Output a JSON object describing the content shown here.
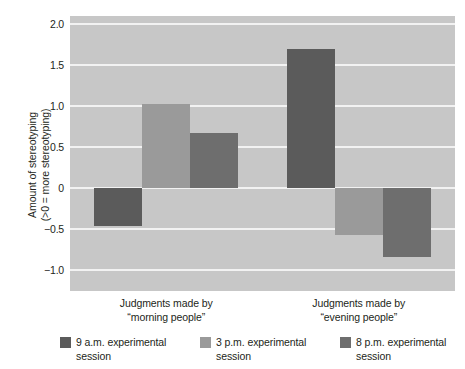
{
  "chart_data": {
    "type": "bar",
    "title": "",
    "xlabel": "",
    "ylabel_line1": "Amount of stereotyping",
    "ylabel_line2": "(>0 = more stereotyping)",
    "categories": [
      "Judgments made by\n“morning people”",
      "Judgments made by\n“evening people”"
    ],
    "category_lines": [
      [
        "Judgments made by",
        "“morning people”"
      ],
      [
        "Judgments made by",
        "“evening people”"
      ]
    ],
    "series": [
      {
        "name": "9 a.m. experimental session",
        "values": [
          -0.46,
          1.7
        ],
        "color": "#5b5b5b"
      },
      {
        "name": "3 p.m. experimental session",
        "values": [
          1.03,
          -0.57
        ],
        "color": "#9a9a9a"
      },
      {
        "name": "8 p.m. experimental session",
        "values": [
          0.67,
          -0.84
        ],
        "color": "#6e6e6e"
      }
    ],
    "ylim": [
      -1.25,
      2.1
    ],
    "yticks": [
      2.0,
      1.5,
      1.0,
      0.5,
      0,
      -0.5,
      -1.0
    ],
    "ytick_labels": [
      "2.0",
      "1.5",
      "1.0",
      "0.5",
      "0",
      "−0.5",
      "−1.0"
    ],
    "grid": true,
    "grid_color": "#f2f2f2",
    "plot_background": "#c7c7c7",
    "legend_position": "bottom",
    "legend": [
      {
        "label_line1": "9 a.m. experimental",
        "label_line2": "session",
        "color": "#5b5b5b"
      },
      {
        "label_line1": "3 p.m. experimental",
        "label_line2": "session",
        "color": "#9a9a9a"
      },
      {
        "label_line1": "8 p.m. experimental",
        "label_line2": "session",
        "color": "#6e6e6e"
      }
    ]
  }
}
